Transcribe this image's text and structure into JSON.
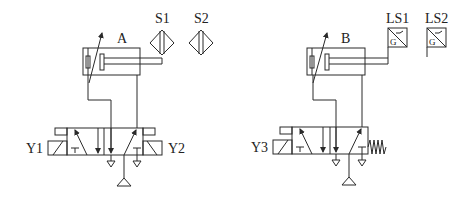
{
  "diagram": {
    "type": "pneumatic-circuit",
    "background": "#ffffff",
    "line_color": "#2a2a2a",
    "circuits": [
      {
        "cylinder_label": "A",
        "sensors": [
          {
            "label": "S1",
            "symbol": "proximity-sensor-diamond"
          },
          {
            "label": "S2",
            "symbol": "proximity-sensor-diamond"
          }
        ],
        "valve": {
          "type": "5/2 double-solenoid",
          "solenoids": [
            "Y1",
            "Y2"
          ]
        }
      },
      {
        "cylinder_label": "B",
        "sensors": [
          {
            "label": "LS1",
            "symbol": "limit-switch",
            "inner_text": "G"
          },
          {
            "label": "LS2",
            "symbol": "limit-switch",
            "inner_text": "G"
          }
        ],
        "valve": {
          "type": "5/2 single-solenoid spring-return",
          "solenoids": [
            "Y3"
          ],
          "return": "spring"
        }
      }
    ]
  }
}
